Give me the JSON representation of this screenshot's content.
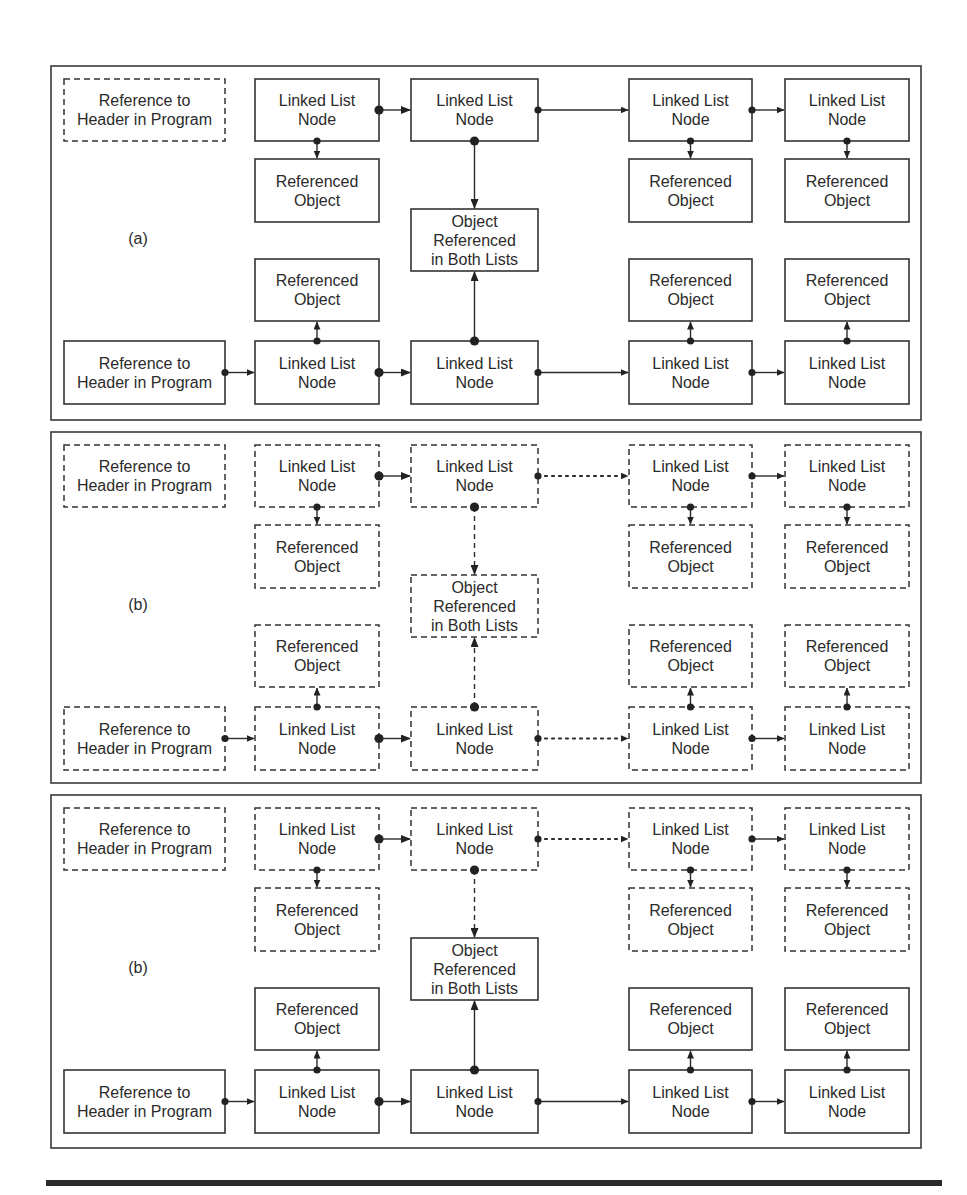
{
  "figure": {
    "colors": {
      "ink": "#2b2b2b",
      "background": "#ffffff"
    },
    "bottom_rule": {
      "visible": true
    }
  },
  "panels": [
    {
      "id": "a",
      "label": "(a)",
      "header_top": {
        "text": [
          "Reference to",
          "Header in Program"
        ],
        "style": "dashed"
      },
      "header_bottom": {
        "text": [
          "Reference to",
          "Header in Program"
        ],
        "style": "solid"
      },
      "top_list": {
        "nodes": [
          {
            "text": [
              "Linked List",
              "Node"
            ],
            "style": "solid"
          },
          {
            "text": [
              "Linked List",
              "Node"
            ],
            "style": "solid"
          },
          {
            "text": [
              "Linked List",
              "Node"
            ],
            "style": "solid"
          },
          {
            "text": [
              "Linked List",
              "Node"
            ],
            "style": "solid"
          }
        ],
        "objects": [
          {
            "text": [
              "Referenced",
              "Object"
            ],
            "style": "solid"
          },
          null,
          {
            "text": [
              "Referenced",
              "Object"
            ],
            "style": "solid"
          },
          {
            "text": [
              "Referenced",
              "Object"
            ],
            "style": "solid"
          }
        ],
        "links": [
          "solid",
          "solid",
          "solid"
        ],
        "object_links": [
          "solid",
          "solid",
          "solid",
          "solid"
        ]
      },
      "shared_object": {
        "text": [
          "Object",
          "Referenced",
          "in Both Lists"
        ],
        "style": "solid"
      },
      "bottom_list": {
        "nodes": [
          {
            "text": [
              "Linked List",
              "Node"
            ],
            "style": "solid"
          },
          {
            "text": [
              "Linked List",
              "Node"
            ],
            "style": "solid"
          },
          {
            "text": [
              "Linked List",
              "Node"
            ],
            "style": "solid"
          },
          {
            "text": [
              "Linked List",
              "Node"
            ],
            "style": "solid"
          }
        ],
        "objects": [
          {
            "text": [
              "Referenced",
              "Object"
            ],
            "style": "solid"
          },
          null,
          {
            "text": [
              "Referenced",
              "Object"
            ],
            "style": "solid"
          },
          {
            "text": [
              "Referenced",
              "Object"
            ],
            "style": "solid"
          }
        ],
        "header_link": "solid",
        "links": [
          "solid",
          "solid",
          "solid"
        ],
        "object_links": [
          "solid",
          "solid",
          "solid",
          "solid"
        ]
      }
    },
    {
      "id": "b",
      "label": "(b)",
      "header_top": {
        "text": [
          "Reference to",
          "Header in Program"
        ],
        "style": "dashed"
      },
      "header_bottom": {
        "text": [
          "Reference to",
          "Header in Program"
        ],
        "style": "dashed"
      },
      "top_list": {
        "nodes": [
          {
            "text": [
              "Linked List",
              "Node"
            ],
            "style": "dashed"
          },
          {
            "text": [
              "Linked List",
              "Node"
            ],
            "style": "dashed"
          },
          {
            "text": [
              "Linked List",
              "Node"
            ],
            "style": "dashed"
          },
          {
            "text": [
              "Linked List",
              "Node"
            ],
            "style": "dashed"
          }
        ],
        "objects": [
          {
            "text": [
              "Referenced",
              "Object"
            ],
            "style": "dashed"
          },
          null,
          {
            "text": [
              "Referenced",
              "Object"
            ],
            "style": "dashed"
          },
          {
            "text": [
              "Referenced",
              "Object"
            ],
            "style": "dashed"
          }
        ],
        "links": [
          "solid",
          "dotted",
          "solid"
        ],
        "object_links": [
          "solid",
          "dashed",
          "solid",
          "solid"
        ]
      },
      "shared_object": {
        "text": [
          "Object",
          "Referenced",
          "in Both Lists"
        ],
        "style": "dashed"
      },
      "bottom_list": {
        "nodes": [
          {
            "text": [
              "Linked List",
              "Node"
            ],
            "style": "dashed"
          },
          {
            "text": [
              "Linked List",
              "Node"
            ],
            "style": "dashed"
          },
          {
            "text": [
              "Linked List",
              "Node"
            ],
            "style": "dashed"
          },
          {
            "text": [
              "Linked List",
              "Node"
            ],
            "style": "dashed"
          }
        ],
        "objects": [
          {
            "text": [
              "Referenced",
              "Object"
            ],
            "style": "dashed"
          },
          null,
          {
            "text": [
              "Referenced",
              "Object"
            ],
            "style": "dashed"
          },
          {
            "text": [
              "Referenced",
              "Object"
            ],
            "style": "dashed"
          }
        ],
        "header_link": "solid",
        "links": [
          "solid",
          "dotted",
          "solid"
        ],
        "object_links": [
          "solid",
          "dashed",
          "solid",
          "solid"
        ]
      }
    },
    {
      "id": "c",
      "label": "(b)",
      "header_top": {
        "text": [
          "Reference to",
          "Header in Program"
        ],
        "style": "dashed"
      },
      "header_bottom": {
        "text": [
          "Reference to",
          "Header in Program"
        ],
        "style": "solid"
      },
      "top_list": {
        "nodes": [
          {
            "text": [
              "Linked List",
              "Node"
            ],
            "style": "dashed"
          },
          {
            "text": [
              "Linked List",
              "Node"
            ],
            "style": "dashed"
          },
          {
            "text": [
              "Linked List",
              "Node"
            ],
            "style": "dashed"
          },
          {
            "text": [
              "Linked List",
              "Node"
            ],
            "style": "dashed"
          }
        ],
        "objects": [
          {
            "text": [
              "Referenced",
              "Object"
            ],
            "style": "dashed"
          },
          null,
          {
            "text": [
              "Referenced",
              "Object"
            ],
            "style": "dashed"
          },
          {
            "text": [
              "Referenced",
              "Object"
            ],
            "style": "dashed"
          }
        ],
        "links": [
          "solid",
          "dotted",
          "solid"
        ],
        "object_links": [
          "solid",
          "dashed",
          "solid",
          "solid"
        ]
      },
      "shared_object": {
        "text": [
          "Object",
          "Referenced",
          "in Both Lists"
        ],
        "style": "solid"
      },
      "bottom_list": {
        "nodes": [
          {
            "text": [
              "Linked List",
              "Node"
            ],
            "style": "solid"
          },
          {
            "text": [
              "Linked List",
              "Node"
            ],
            "style": "solid"
          },
          {
            "text": [
              "Linked List",
              "Node"
            ],
            "style": "solid"
          },
          {
            "text": [
              "Linked List",
              "Node"
            ],
            "style": "solid"
          }
        ],
        "objects": [
          {
            "text": [
              "Referenced",
              "Object"
            ],
            "style": "solid"
          },
          null,
          {
            "text": [
              "Referenced",
              "Object"
            ],
            "style": "solid"
          },
          {
            "text": [
              "Referenced",
              "Object"
            ],
            "style": "solid"
          }
        ],
        "header_link": "solid",
        "links": [
          "solid",
          "solid",
          "solid"
        ],
        "object_links": [
          "solid",
          "solid",
          "solid",
          "solid"
        ]
      }
    }
  ]
}
